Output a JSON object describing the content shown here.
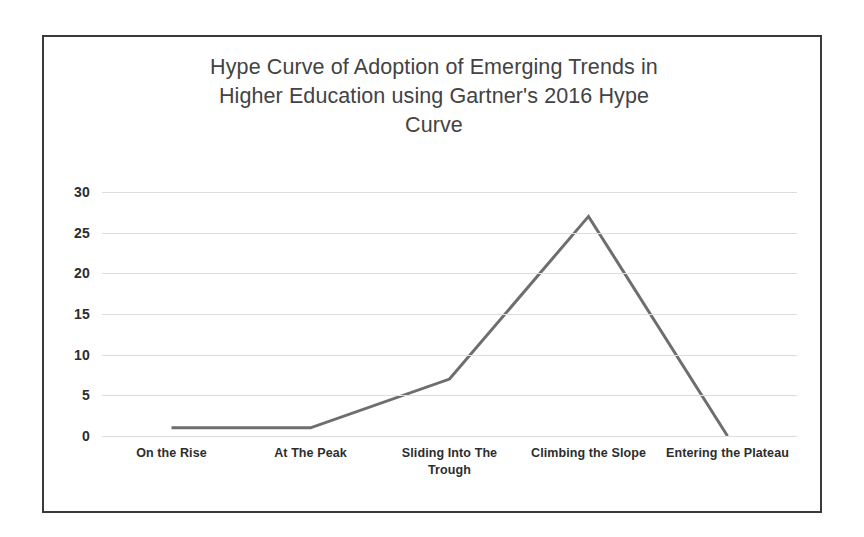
{
  "chart_data": {
    "type": "line",
    "title": "Hype Curve of Adoption of Emerging Trends in Higher Education using Gartner's 2016 Hype Curve",
    "title_lines": "Hype Curve of Adoption of Emerging Trends in\nHigher Education using Gartner's 2016 Hype\nCurve",
    "xlabel": "",
    "ylabel": "",
    "categories": [
      "On the Rise",
      "At The Peak",
      "Sliding Into The Trough",
      "Climbing the Slope",
      "Entering the Plateau"
    ],
    "values": [
      1,
      1,
      7,
      27,
      0
    ],
    "series": [
      {
        "name": "Number of Trends",
        "values": [
          1,
          1,
          7,
          27,
          0
        ]
      }
    ],
    "ylim": [
      0,
      30
    ],
    "y_ticks": [
      0,
      5,
      10,
      15,
      20,
      25,
      30
    ],
    "y_tick_labels": [
      "0",
      "5",
      "10",
      "15",
      "20",
      "25",
      "30"
    ],
    "grid": "horizontal",
    "legend": "none",
    "markers": "none",
    "line_color": "#6e6e6e",
    "line_width": 3,
    "gridline_color": "#dedede",
    "border_color": "#3a3a3a",
    "title_color": "#434343",
    "axis_text_color": "#2d2d2d",
    "background_color": "#ffffff"
  }
}
